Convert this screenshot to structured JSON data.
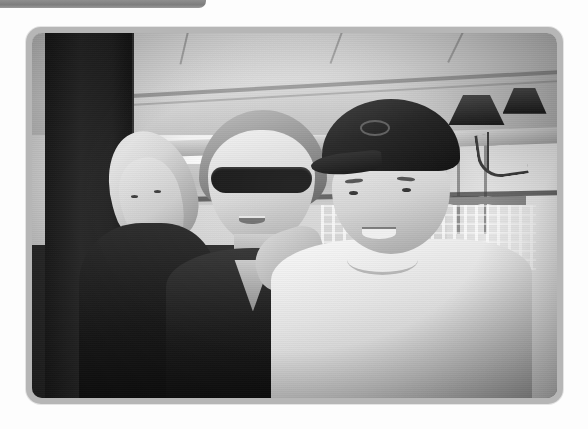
{
  "window": {
    "tab_bar_label": "",
    "background_color": "#fdfdfd",
    "chrome_color": "#8e8e8e"
  },
  "photo": {
    "frame_color": "#b6b6b6",
    "corner_radius_px": 15,
    "rendering": "grayscale",
    "alt_text": "Black and white photograph of three people posing together on a shaded seaside restaurant patio",
    "subjects": [
      {
        "id": "left-person",
        "description": "Woman wearing a light-colored bandana headscarf and a dark top, leaning in from the left",
        "position": "left"
      },
      {
        "id": "center-person",
        "description": "Woman with short light hair wearing large dark sunglasses and a dark V-neck top, smiling",
        "position": "center"
      },
      {
        "id": "right-person",
        "description": "Young man in a dark baseball cap with a small logo, wearing a white t-shirt, smiling broadly",
        "position": "right"
      }
    ],
    "scene_elements": [
      {
        "id": "canopy",
        "label": "White tensioned awning ceiling"
      },
      {
        "id": "pillar",
        "label": "Dark structural pillar at left"
      },
      {
        "id": "umbrellas",
        "label": "White patio umbrellas"
      },
      {
        "id": "palms",
        "label": "Palm trees in the background"
      },
      {
        "id": "sconce",
        "label": "Wall sconce lamp with dark shade"
      },
      {
        "id": "chairs",
        "label": "White wrought iron patio chairs"
      },
      {
        "id": "sea",
        "label": "Distant sea and hillside"
      },
      {
        "id": "right-wall",
        "label": "Sunlit stucco wall on the right"
      }
    ]
  }
}
